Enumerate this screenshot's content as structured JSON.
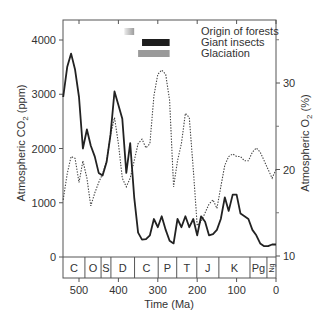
{
  "chart_data": {
    "type": "line",
    "title": "",
    "xlabel": "Time (Ma)",
    "ylabel_left": "Atmospheric CO2 (ppm)",
    "ylabel_right": "Atmospheric O2 (%)",
    "xlim": [
      540,
      0
    ],
    "ylim_left": [
      0,
      4300
    ],
    "ylim_right": [
      10,
      37
    ],
    "x_ticks": [
      500,
      400,
      300,
      200,
      100,
      0
    ],
    "y_ticks_left": [
      0,
      1000,
      2000,
      3000,
      4000
    ],
    "y_ticks_right": [
      10,
      20,
      30
    ],
    "grid": false,
    "series": [
      {
        "name": "Atmospheric CO2",
        "axis": "left",
        "style": "solid",
        "color": "#222222",
        "points": [
          [
            540,
            2950
          ],
          [
            530,
            3500
          ],
          [
            520,
            3750
          ],
          [
            510,
            3450
          ],
          [
            500,
            2950
          ],
          [
            490,
            2000
          ],
          [
            480,
            2350
          ],
          [
            470,
            2050
          ],
          [
            460,
            1850
          ],
          [
            450,
            1550
          ],
          [
            440,
            1500
          ],
          [
            430,
            1750
          ],
          [
            420,
            2250
          ],
          [
            410,
            3050
          ],
          [
            400,
            2800
          ],
          [
            390,
            2550
          ],
          [
            380,
            1550
          ],
          [
            370,
            2100
          ],
          [
            365,
            1600
          ],
          [
            360,
            1100
          ],
          [
            350,
            450
          ],
          [
            340,
            320
          ],
          [
            330,
            330
          ],
          [
            320,
            400
          ],
          [
            310,
            700
          ],
          [
            300,
            550
          ],
          [
            290,
            750
          ],
          [
            280,
            500
          ],
          [
            270,
            300
          ],
          [
            260,
            250
          ],
          [
            250,
            700
          ],
          [
            240,
            550
          ],
          [
            230,
            750
          ],
          [
            220,
            550
          ],
          [
            210,
            700
          ],
          [
            200,
            400
          ],
          [
            190,
            750
          ],
          [
            180,
            650
          ],
          [
            170,
            400
          ],
          [
            160,
            420
          ],
          [
            150,
            500
          ],
          [
            140,
            700
          ],
          [
            130,
            1100
          ],
          [
            120,
            850
          ],
          [
            110,
            1150
          ],
          [
            100,
            1150
          ],
          [
            90,
            800
          ],
          [
            80,
            750
          ],
          [
            70,
            700
          ],
          [
            60,
            500
          ],
          [
            50,
            400
          ],
          [
            40,
            250
          ],
          [
            30,
            200
          ],
          [
            20,
            200
          ],
          [
            10,
            230
          ],
          [
            0,
            230
          ]
        ]
      },
      {
        "name": "Atmospheric O2",
        "axis": "right",
        "style": "dotted",
        "color": "#444444",
        "points": [
          [
            540,
            16.5
          ],
          [
            530,
            19.5
          ],
          [
            520,
            21.5
          ],
          [
            510,
            21.3
          ],
          [
            500,
            18.5
          ],
          [
            490,
            21
          ],
          [
            480,
            19
          ],
          [
            470,
            15.8
          ],
          [
            460,
            17.3
          ],
          [
            450,
            18.5
          ],
          [
            440,
            19.5
          ],
          [
            430,
            21
          ],
          [
            420,
            24
          ],
          [
            410,
            26
          ],
          [
            400,
            23
          ],
          [
            390,
            19
          ],
          [
            380,
            18
          ],
          [
            370,
            19
          ],
          [
            360,
            21
          ],
          [
            350,
            23
          ],
          [
            340,
            23.5
          ],
          [
            330,
            22.5
          ],
          [
            320,
            23
          ],
          [
            310,
            28.5
          ],
          [
            300,
            31
          ],
          [
            290,
            31.5
          ],
          [
            280,
            31
          ],
          [
            270,
            28
          ],
          [
            260,
            18
          ],
          [
            250,
            21
          ],
          [
            240,
            23
          ],
          [
            230,
            26.5
          ],
          [
            220,
            26
          ],
          [
            210,
            20
          ],
          [
            200,
            13.5
          ],
          [
            190,
            14
          ],
          [
            180,
            15
          ],
          [
            170,
            16
          ],
          [
            160,
            16.5
          ],
          [
            150,
            15.5
          ],
          [
            140,
            18
          ],
          [
            130,
            20.5
          ],
          [
            120,
            21.5
          ],
          [
            110,
            21.8
          ],
          [
            100,
            21.5
          ],
          [
            90,
            21.5
          ],
          [
            80,
            21
          ],
          [
            70,
            21
          ],
          [
            60,
            22
          ],
          [
            50,
            22.5
          ],
          [
            40,
            22
          ],
          [
            30,
            21
          ],
          [
            20,
            20
          ],
          [
            10,
            19
          ],
          [
            0,
            20
          ]
        ]
      }
    ],
    "geologic_periods": [
      {
        "label": "C",
        "start": 541,
        "end": 485
      },
      {
        "label": "O",
        "start": 485,
        "end": 444
      },
      {
        "label": "S",
        "start": 444,
        "end": 419
      },
      {
        "label": "D",
        "start": 419,
        "end": 359
      },
      {
        "label": "C",
        "start": 359,
        "end": 299
      },
      {
        "label": "P",
        "start": 299,
        "end": 252
      },
      {
        "label": "T",
        "start": 252,
        "end": 201
      },
      {
        "label": "J",
        "start": 201,
        "end": 145
      },
      {
        "label": "K",
        "start": 145,
        "end": 66
      },
      {
        "label": "Pg",
        "start": 66,
        "end": 23
      },
      {
        "label": "Ng",
        "start": 23,
        "end": 0
      }
    ],
    "legend": [
      {
        "label": "Origin of forests",
        "color_style": "gradient-gray",
        "x_start": 385,
        "x_end": 360
      },
      {
        "label": "Giant insects",
        "color_style": "black",
        "x_start": 340,
        "x_end": 270
      },
      {
        "label": "Glaciation",
        "color_style": "gray",
        "x_start": 350,
        "x_end": 270
      }
    ]
  },
  "labels": {
    "xlabel": "Time (Ma)",
    "ylabel_left_prefix": "Atmospheric CO",
    "ylabel_left_sub": "2",
    "ylabel_left_suffix": " (ppm)",
    "ylabel_right_prefix": "Atmospheric O",
    "ylabel_right_sub": "2",
    "ylabel_right_suffix": " (%)",
    "legend_forests": "Origin of forests",
    "legend_insects": "Giant insects",
    "legend_glaciation": "Glaciation"
  },
  "colors": {
    "co2_line": "#222222",
    "o2_line": "#444444",
    "frame": "#555555",
    "insects_bar": "#1e1e1e",
    "glaciation_bar": "#9a9a9a",
    "forests_bar_dark": "#a0a0a0",
    "forests_bar_light": "#e6e6e6"
  }
}
